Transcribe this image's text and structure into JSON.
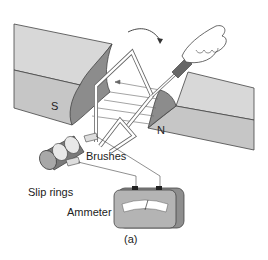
{
  "diagram": {
    "labels": {
      "south_pole": "S",
      "north_pole": "N",
      "brushes": "Brushes",
      "slip_rings": "Slip rings",
      "ammeter": "Ammeter",
      "caption": "(a)"
    },
    "components": [
      "magnet-south-pole",
      "magnet-north-pole",
      "rotating-coil",
      "magnetic-field-lines",
      "hand-crank",
      "slip-rings",
      "brushes",
      "ammeter"
    ],
    "colors": {
      "magnet_top": "#d6d6d6",
      "magnet_side": "#c4c4c4",
      "magnet_face": "#8a8a8a",
      "coil": "#ffffff",
      "outline": "#444444",
      "ammeter_body": "#9a9a9a"
    }
  }
}
